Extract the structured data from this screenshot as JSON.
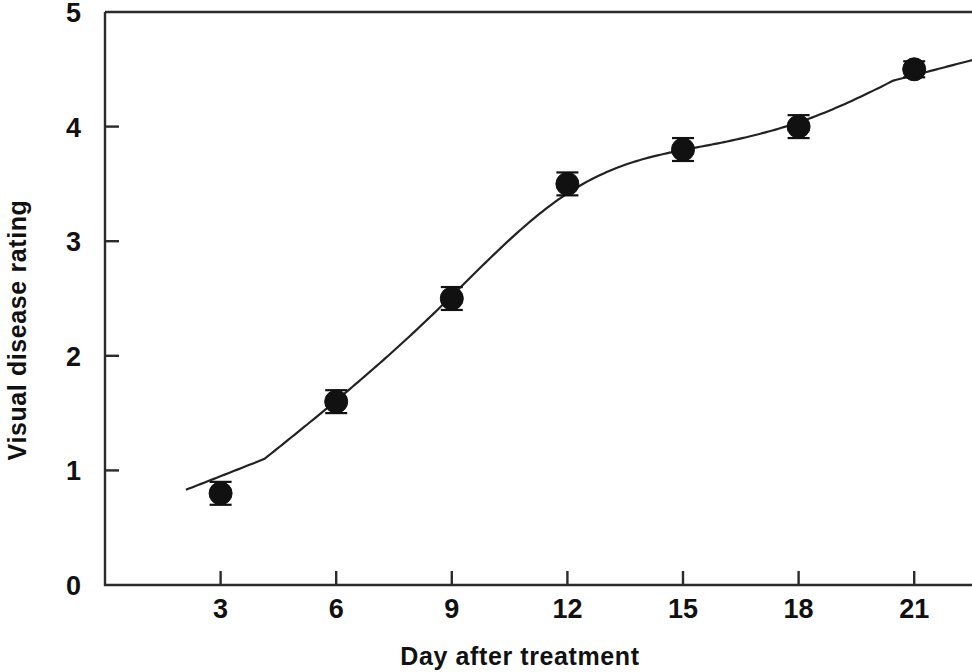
{
  "chart_data": {
    "type": "scatter",
    "title": "",
    "subtitle": "",
    "xlabel": "Day after treatment",
    "ylabel": "Visual disease rating",
    "x": [
      3,
      6,
      9,
      12,
      15,
      18,
      21
    ],
    "values": [
      0.8,
      1.6,
      2.5,
      3.5,
      3.8,
      4.0,
      4.5
    ],
    "errors": [
      0.1,
      0.1,
      0.1,
      0.1,
      0.1,
      0.1,
      0.07
    ],
    "series": [
      {
        "name": "Visual disease rating",
        "values": [
          0.8,
          1.6,
          2.5,
          3.5,
          3.8,
          4.0,
          4.5
        ],
        "errors": [
          0.1,
          0.1,
          0.1,
          0.1,
          0.1,
          0.1,
          0.07
        ],
        "marker": "filled-circle",
        "marker_color": "#111111",
        "has_fit_curve": true,
        "fit_curve_color": "#222222"
      }
    ],
    "xlim": [
      0,
      22.5
    ],
    "ylim": [
      0,
      5
    ],
    "xticks": [
      3,
      6,
      9,
      12,
      15,
      18,
      21
    ],
    "yticks": [
      0,
      1,
      2,
      3,
      4,
      5
    ],
    "xtick_labels": [
      "3",
      "6",
      "9",
      "12",
      "15",
      "18",
      "21"
    ],
    "ytick_labels": [
      "0",
      "1",
      "2",
      "3",
      "4",
      "5"
    ],
    "grid": false,
    "legend": "none",
    "annotations": [],
    "background_color": "#ffffff",
    "axis_color": "#2b2b2b"
  },
  "axes": {
    "x_title": "Day after treatment",
    "y_title": "Visual disease rating"
  }
}
